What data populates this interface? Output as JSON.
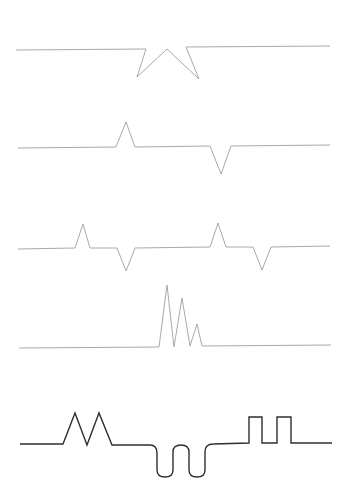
{
  "diagram": {
    "background": "#ffffff",
    "colors": {
      "light_stroke": "#a9a9a9",
      "dark_stroke": "#2e2e2e"
    },
    "waveforms": [
      {
        "id": "waveform-1",
        "description": "baseline with inverted star-like double notch",
        "style": "light",
        "points": "16,50 146,49 137,77 167,49 199,79 186,47 330,46"
      },
      {
        "id": "waveform-2",
        "description": "single upward spike followed by single downward spike",
        "style": "light",
        "points": "18,148 116,147 126,122 135,147 210,146 221,174 231,146 330,145"
      },
      {
        "id": "waveform-3",
        "description": "two repeated up-spike / down-spike pairs",
        "style": "light",
        "points": "18,249 75,248 83,224 90,248 117,248 126,271 135,248 210,247 218,223 226,247 253,247 262,270 271,247 330,246"
      },
      {
        "id": "waveform-4",
        "description": "decaying triple upward spike burst",
        "style": "light",
        "points": "19,348 159,347 167,285 174,347 182,298 190,346 197,324 202,346 331,345"
      },
      {
        "id": "waveform-5",
        "description": "composite: double triangle peaks, double rounded U-trough, double square pulse",
        "style": "dark",
        "path": "M20,444 L63,444 L75,413 L87,445 L99,413 L112,445 L150,445 Q157,445 157,453 L157,470 Q157,477 165,477 Q173,477 173,470 L173,452 Q173,445 181,445 Q189,445 189,452 L189,470 Q189,477 197,477 Q205,477 205,470 L205,452 Q205,444 213,444 L249,443 L249,417 L262,417 L262,443 L277,443 L277,417 L291,417 L291,443 L332,443"
      }
    ]
  }
}
